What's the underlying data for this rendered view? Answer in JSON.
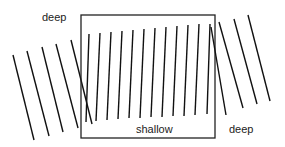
{
  "diagram": {
    "labels": {
      "deep_left": "deep",
      "shallow": "shallow",
      "deep_right": "deep"
    },
    "colors": {
      "line": "#111111",
      "box": "#222222",
      "background": "#ffffff"
    }
  }
}
